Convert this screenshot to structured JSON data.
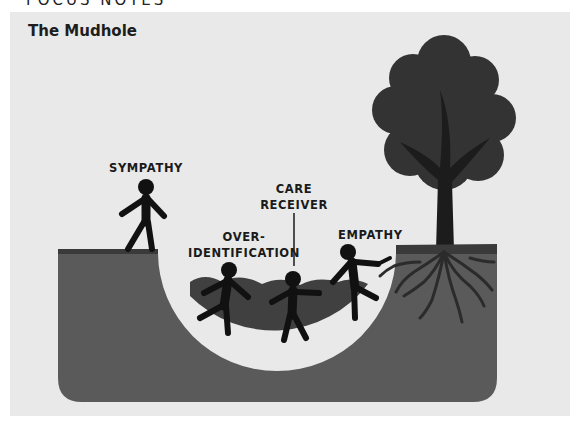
{
  "header": {
    "running_head": "FOCUS NOTES"
  },
  "figure": {
    "title": "The Mudhole",
    "labels": {
      "sympathy": "SYMPATHY",
      "over_identification_line1": "OVER-",
      "over_identification_line2": "IDENTIFICATION",
      "care_receiver_line1": "CARE",
      "care_receiver_line2": "RECEIVER",
      "empathy": "EMPATHY"
    },
    "colors": {
      "panel_background": "#e9e9e9",
      "ground": "#5a5a5a",
      "ground_top_edge": "#3a3a3a",
      "mud": "#404040",
      "figure_fill": "#111111",
      "tree_canopy": "#333333",
      "tree_trunk": "#1c1c1c"
    }
  }
}
